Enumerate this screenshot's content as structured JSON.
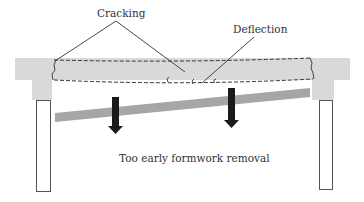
{
  "diagram": {
    "labels": {
      "cracking": "Cracking",
      "deflection": "Deflection",
      "caption": "Too early formwork removal"
    },
    "colors": {
      "concrete": "#d9d9d9",
      "formwork": "#a6a6a6",
      "arrow": "#1a1a1a",
      "line": "#333333",
      "column_outline": "#555555",
      "background": "#ffffff"
    },
    "elements": {
      "slab": "concrete slab with dashed deflected beam outline",
      "left_support": "left column with capital",
      "right_support": "right column with capital",
      "formwork": "tilted formwork prop being removed",
      "load_arrows": [
        "left-load-arrow",
        "right-load-arrow"
      ],
      "crack_marks": [
        "left-end-crack",
        "right-end-crack",
        "midspan-crack-1",
        "midspan-crack-2",
        "midspan-crack-3"
      ]
    }
  }
}
